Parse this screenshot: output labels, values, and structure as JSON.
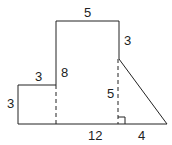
{
  "diagram": {
    "labels": {
      "top_width": "5",
      "right_upper": "3",
      "inner_left_height": "8",
      "small_top": "3",
      "small_left": "3",
      "inner_right_height": "5",
      "base": "12",
      "triangle_base": "4"
    },
    "colors": {
      "stroke": "#222222",
      "background": "#ffffff"
    }
  }
}
